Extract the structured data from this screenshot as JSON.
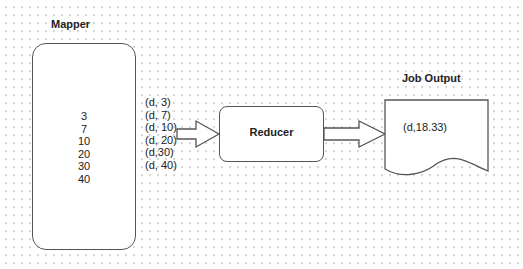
{
  "diagram": {
    "mapper": {
      "title": "Mapper",
      "values": [
        "3",
        "7",
        "10",
        "20",
        "30",
        "40"
      ]
    },
    "intermediate_pairs": [
      "(d, 3)",
      "(d, 7)",
      "(d, 10)",
      "(d, 20)",
      "(d,30)",
      "(d, 40)"
    ],
    "reducer": {
      "label": "Reducer"
    },
    "output": {
      "title": "Job Output",
      "value": "(d,18.33)"
    },
    "edges": [
      {
        "from": "mapper",
        "to": "reducer",
        "style": "block-arrow"
      },
      {
        "from": "reducer",
        "to": "output",
        "style": "block-arrow"
      }
    ],
    "colors": {
      "stroke": "#555555",
      "text": "#222222",
      "background_dots": "#d6d6d6"
    }
  }
}
